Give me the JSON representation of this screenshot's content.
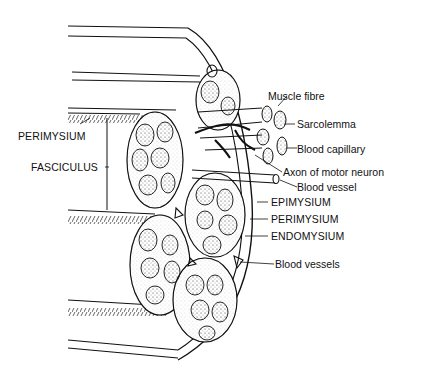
{
  "diagram": {
    "labels_left": {
      "perimysium": "PERIMYSIUM",
      "fasciculus": "FASCICULUS"
    },
    "labels_right": {
      "muscle_fibre": "Muscle fibre",
      "sarcolemma": "Sarcolemma",
      "blood_capillary": "Blood capillary",
      "axon": "Axon of motor neuron",
      "blood_vessel": "Blood vessel",
      "epimysium": "EPIMYSIUM",
      "perimysium": "PERIMYSIUM",
      "endomysium": "ENDOMYSIUM",
      "blood_vessels": "Blood vessels"
    },
    "colors": {
      "ink": "#111111",
      "paper": "#ffffff",
      "stipple": "#555555"
    }
  }
}
